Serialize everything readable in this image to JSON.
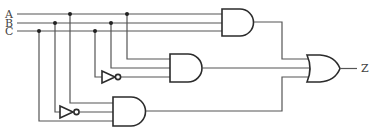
{
  "diagram": {
    "type": "logic-circuit",
    "inputs": [
      {
        "id": "A",
        "label": "A"
      },
      {
        "id": "B",
        "label": "B"
      },
      {
        "id": "C",
        "label": "C"
      }
    ],
    "output": {
      "id": "Z",
      "label": "Z"
    },
    "gates": [
      {
        "id": "and1",
        "type": "AND",
        "inputs": [
          "A",
          "B",
          "C"
        ]
      },
      {
        "id": "not1",
        "type": "NOT",
        "inputs": [
          "C"
        ]
      },
      {
        "id": "and2",
        "type": "AND",
        "inputs": [
          "A",
          "B",
          "NOT C"
        ]
      },
      {
        "id": "not2",
        "type": "NOT",
        "inputs": [
          "B"
        ]
      },
      {
        "id": "and3",
        "type": "AND",
        "inputs": [
          "A",
          "NOT B",
          "C"
        ]
      },
      {
        "id": "or1",
        "type": "OR",
        "inputs": [
          "and1",
          "and2",
          "and3"
        ],
        "output": "Z"
      }
    ],
    "expression": "Z = ABC + AB¬C + A¬BC"
  }
}
